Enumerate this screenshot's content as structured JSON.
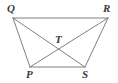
{
  "figure": {
    "name": "trapezoid-with-diagonals",
    "width": 118,
    "height": 83,
    "background_color": "#ffffff",
    "line_color": "#808080",
    "line_width": 1,
    "label_color": "#3a3a3a"
  },
  "labels": {
    "Q": "Q",
    "R": "R",
    "T": "T",
    "P": "P",
    "S": "S"
  },
  "points": {
    "Q": {
      "x": 13,
      "y": 18
    },
    "R": {
      "x": 108,
      "y": 18
    },
    "P": {
      "x": 30,
      "y": 67
    },
    "S": {
      "x": 85,
      "y": 67
    },
    "T": {
      "x": 58,
      "y": 47
    }
  },
  "segments": [
    {
      "name": "QR",
      "from": "Q",
      "to": "R",
      "kind": "side"
    },
    {
      "name": "QP",
      "from": "Q",
      "to": "P",
      "kind": "side"
    },
    {
      "name": "RS",
      "from": "R",
      "to": "S",
      "kind": "side"
    },
    {
      "name": "PS",
      "from": "P",
      "to": "S",
      "kind": "side"
    },
    {
      "name": "QS",
      "from": "Q",
      "to": "S",
      "kind": "diagonal"
    },
    {
      "name": "RP",
      "from": "R",
      "to": "P",
      "kind": "diagonal"
    }
  ]
}
